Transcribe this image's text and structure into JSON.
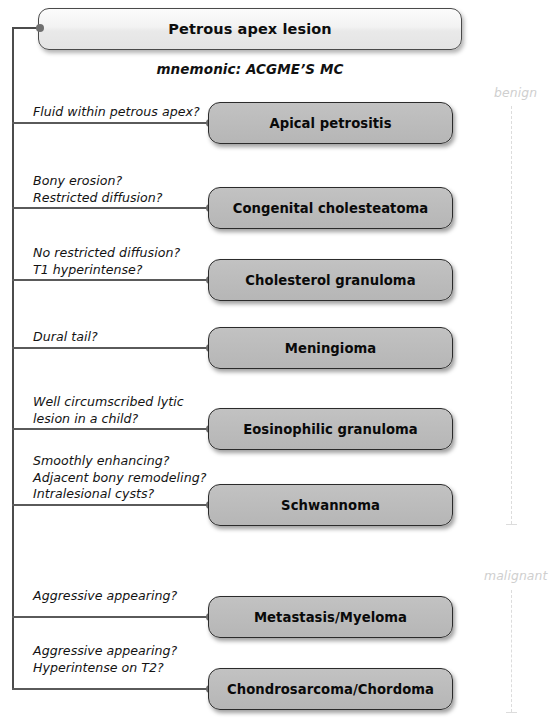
{
  "diagram": {
    "root": {
      "label": "Petrous apex lesion"
    },
    "mnemonic": "mnemonic: ACGME’S MC",
    "axis": {
      "benign_label": "benign",
      "malignant_label": "malignant"
    },
    "branches": [
      {
        "question": "Fluid within petrous apex?",
        "node": "Apical petrositis",
        "category": "benign"
      },
      {
        "question": "Bony erosion?\nRestricted diffusion?",
        "node": "Congenital cholesteatoma",
        "category": "benign"
      },
      {
        "question": "No restricted diffusion?\nT1 hyperintense?",
        "node": "Cholesterol granuloma",
        "category": "benign"
      },
      {
        "question": "Dural tail?",
        "node": "Meningioma",
        "category": "benign"
      },
      {
        "question": "Well circumscribed lytic\nlesion in a child?",
        "node": "Eosinophilic granuloma",
        "category": "benign"
      },
      {
        "question": "Smoothly enhancing?\nAdjacent bony remodeling?\nIntralesional cysts?",
        "node": "Schwannoma",
        "category": "benign"
      },
      {
        "question": "Aggressive appearing?",
        "node": "Metastasis/Myeloma",
        "category": "malignant"
      },
      {
        "question": "Aggressive appearing?\nHyperintense on T2?",
        "node": "Chondrosarcoma/Chordoma",
        "category": "malignant"
      }
    ],
    "colors": {
      "node_fill": "#bdbdbd",
      "root_fill": "#f2f2f2",
      "node_border": "#2b2b2b",
      "connector": "#5a5a5a",
      "axis": "#dcdcdc"
    }
  }
}
